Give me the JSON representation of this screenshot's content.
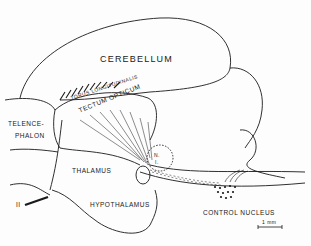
{
  "diagram": {
    "labels": {
      "cerebellum": "CEREBELLUM",
      "torus": "TORUS LONGITUDINALIS",
      "tectum": "TECTUM OPTICUM",
      "telencephalon_1": "TELENCE-",
      "telencephalon_2": "PHALON",
      "thalamus": "THALAMUS",
      "hypothalamus": "HYPOTHALAMUS",
      "optic_nerve": "II",
      "ni_1": "N.",
      "ni_2": "I.",
      "control_nucleus": "CONTROL NUCLEUS",
      "scale": "1 mm"
    },
    "stroke_color": "#1a1a1a",
    "background": "#fdfdfd"
  }
}
